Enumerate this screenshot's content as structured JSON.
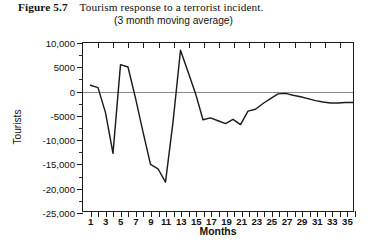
{
  "caption": {
    "figure_number": "Figure 5.7",
    "title": "Tourism response to a terrorist incident.",
    "subtitle": "(3 month moving average)"
  },
  "colors": {
    "series_line": "#1b1b1b",
    "axis": "#1b1b1b",
    "zero_line": "#8a8a8a",
    "text": "#111111",
    "background": "#ffffff"
  },
  "chart_data": {
    "type": "line",
    "title": "Tourism response to a terrorist incident.",
    "subtitle": "(3 month moving average)",
    "xlabel": "Months",
    "ylabel": "Tourists",
    "xlim": [
      0,
      36
    ],
    "ylim": [
      -25000,
      10000
    ],
    "ytick_step": 5000,
    "yticks": [
      10000,
      5000,
      0,
      -5000,
      -10000,
      -15000,
      -20000,
      -25000
    ],
    "ytick_labels": [
      "10,000",
      "5000",
      "0",
      "-5000",
      "-10,000",
      "-15,000",
      "-20,000",
      "-25,000"
    ],
    "xticks": [
      1,
      3,
      5,
      7,
      9,
      11,
      13,
      15,
      17,
      19,
      21,
      23,
      25,
      27,
      29,
      31,
      33,
      35
    ],
    "xtick_labels": [
      "1",
      "3",
      "5",
      "7",
      "9",
      "11",
      "13",
      "15",
      "17",
      "19",
      "21",
      "23",
      "25",
      "27",
      "29",
      "31",
      "33",
      "35"
    ],
    "xtick_minor_step": 1,
    "grid": false,
    "legend": false,
    "zero_reference_line": 0,
    "series": [
      {
        "name": "Tourists (3 month moving average)",
        "color": "#1b1b1b",
        "x": [
          1,
          2,
          3,
          4,
          5,
          6,
          7,
          8,
          9,
          10,
          11,
          12,
          13,
          14,
          15,
          16,
          17,
          18,
          19,
          20,
          21,
          22,
          23,
          24,
          25,
          26,
          27,
          28,
          29,
          30,
          31,
          32,
          33,
          34,
          35,
          36
        ],
        "values": [
          1200,
          700,
          -4500,
          -13000,
          5500,
          5000,
          -1500,
          -8500,
          -15300,
          -16200,
          -19000,
          -6500,
          8500,
          4000,
          -500,
          -6000,
          -5600,
          -6200,
          -6800,
          -5900,
          -7000,
          -4200,
          -3800,
          -2600,
          -1600,
          -600,
          -500,
          -900,
          -1200,
          -1600,
          -2000,
          -2300,
          -2500,
          -2500,
          -2400,
          -2400
        ]
      }
    ],
    "annotations": []
  }
}
